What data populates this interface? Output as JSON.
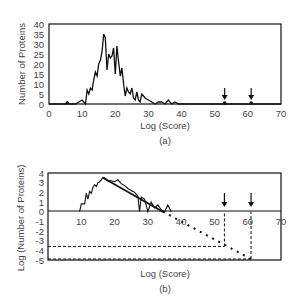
{
  "chart_data": [
    {
      "type": "line",
      "panel_label": "(a)",
      "title": "",
      "xlabel": "Log (Score)",
      "ylabel": "Number of Proteins",
      "xlim": [
        0,
        70
      ],
      "ylim": [
        0,
        40
      ],
      "xticks": [
        "0",
        "10",
        "20",
        "30",
        "40",
        "50",
        "60",
        "70"
      ],
      "yticks": [
        "0",
        "5",
        "10",
        "15",
        "20",
        "25",
        "30",
        "35",
        "40"
      ],
      "grid": false,
      "series": [
        {
          "name": "histogram",
          "x": [
            5,
            5.5,
            6,
            8,
            9,
            10,
            10.5,
            11,
            11.5,
            12,
            12.5,
            13,
            13.5,
            14,
            14.5,
            15,
            15.5,
            16,
            16.5,
            17,
            17.5,
            18,
            18.5,
            19,
            19.5,
            20,
            20.5,
            21,
            21.5,
            22,
            22.5,
            23,
            23.5,
            24,
            24.5,
            25,
            25.5,
            26,
            26.5,
            27,
            27.5,
            28,
            29,
            30,
            31,
            32,
            33,
            34,
            35,
            36,
            37,
            38,
            39
          ],
          "y": [
            0,
            1,
            0,
            0,
            1,
            2,
            1,
            0,
            7,
            5,
            8,
            7,
            12,
            16,
            14,
            20,
            22,
            26,
            35,
            33,
            17,
            25,
            23,
            24,
            28,
            15,
            29,
            21,
            14,
            18,
            10,
            4,
            8,
            6,
            5,
            8,
            3,
            2,
            6,
            2,
            1,
            5,
            3,
            2,
            1,
            0,
            1,
            1,
            0,
            2,
            0,
            1,
            0
          ]
        }
      ],
      "annotations": [
        {
          "type": "arrow",
          "x": 53,
          "direction": "down"
        },
        {
          "type": "arrow",
          "x": 61,
          "direction": "down"
        }
      ],
      "markers": [
        {
          "x": 53,
          "y": 0
        },
        {
          "x": 61,
          "y": 0
        },
        {
          "x": 5.5,
          "y": 0
        }
      ]
    },
    {
      "type": "line",
      "panel_label": "(b)",
      "title": "",
      "xlabel": "Log (Score)",
      "ylabel": "Log (Number of Proteins)",
      "xlim": [
        0,
        70
      ],
      "ylim": [
        -5,
        4
      ],
      "xticks": [
        "10",
        "20",
        "30",
        "40",
        "50",
        "60",
        "70"
      ],
      "yticks": [
        "4",
        "3",
        "2",
        "1",
        "0",
        "-1",
        "-2",
        "-3",
        "-4",
        "-5"
      ],
      "grid": false,
      "series": [
        {
          "name": "log histogram",
          "x": [
            9.5,
            10,
            11,
            11.5,
            12,
            12.5,
            13,
            13.5,
            14,
            14.5,
            15,
            15.5,
            16,
            16.5,
            17,
            18,
            19,
            20,
            21,
            22,
            23,
            24,
            25,
            26,
            27,
            27.5,
            28,
            29,
            30,
            31,
            32,
            33,
            34,
            35,
            36,
            37
          ],
          "y": [
            0,
            0.8,
            0.8,
            1.9,
            1.3,
            2.1,
            1.9,
            2.5,
            2.8,
            2.6,
            3.0,
            3.1,
            3.3,
            3.55,
            3.5,
            3.2,
            3.2,
            3.1,
            3.3,
            2.9,
            2.7,
            2.4,
            2.2,
            2.0,
            1.6,
            0,
            1.5,
            1.3,
            0,
            1.0,
            0.4,
            0.7,
            0.2,
            0,
            0.7,
            0
          ]
        },
        {
          "name": "linear fit",
          "style": "solid",
          "x": [
            16.5,
            34.5
          ],
          "y": [
            3.5,
            0
          ]
        },
        {
          "name": "extrapolation",
          "style": "dotted",
          "x": [
            34.5,
            61
          ],
          "y": [
            0,
            -4.9
          ]
        }
      ],
      "reference_lines": [
        {
          "type": "dashed",
          "from": [
            0,
            -3.6
          ],
          "to": [
            53,
            -3.6
          ]
        },
        {
          "type": "dashed",
          "from": [
            53,
            -3.6
          ],
          "to": [
            53,
            0
          ]
        },
        {
          "type": "dashed",
          "from": [
            0,
            -4.9
          ],
          "to": [
            61,
            -4.9
          ]
        },
        {
          "type": "dashed",
          "from": [
            61,
            -4.9
          ],
          "to": [
            61,
            0
          ]
        }
      ],
      "annotations": [
        {
          "type": "arrow",
          "x": 53,
          "direction": "down"
        },
        {
          "type": "arrow",
          "x": 61,
          "direction": "down"
        }
      ]
    }
  ]
}
